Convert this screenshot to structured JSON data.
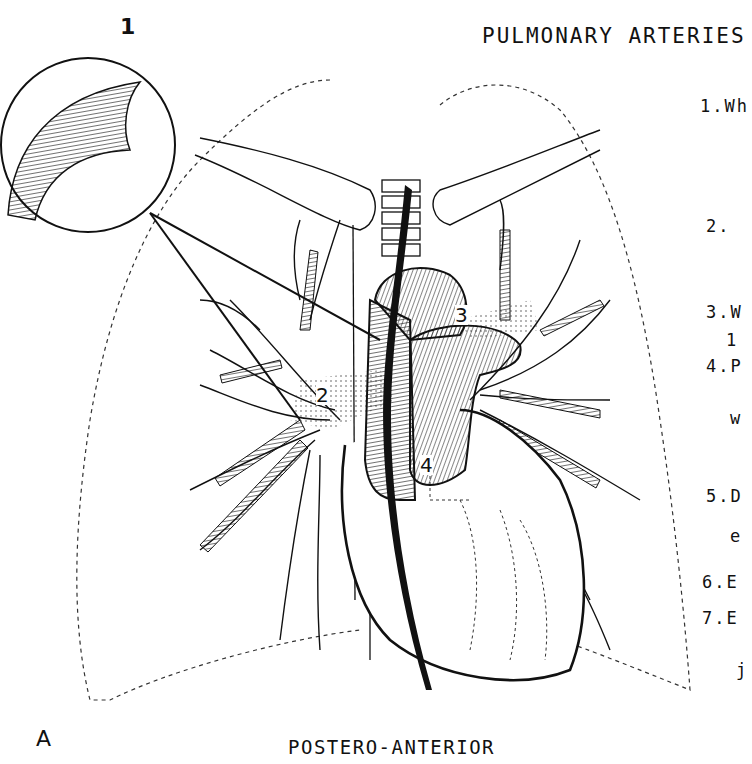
{
  "figure": {
    "title": "PULMONARY ARTERIES",
    "caption": "POSTERO-ANTERIOR",
    "corner_label": "A",
    "inset_label": "1",
    "callout_numbers": [
      "2",
      "3",
      "4"
    ]
  },
  "notes_list": [
    {
      "text": "1.Wh"
    },
    {
      "text": "2. "
    },
    {
      "text": "3.W"
    },
    {
      "text": "1"
    },
    {
      "text": "4.P"
    },
    {
      "text": "w"
    },
    {
      "text": "5.D"
    },
    {
      "text": "e"
    },
    {
      "text": "6.E"
    },
    {
      "text": "7.E"
    },
    {
      "text": "j"
    }
  ],
  "colors": {
    "ink": "#111111",
    "paper": "#ffffff"
  }
}
